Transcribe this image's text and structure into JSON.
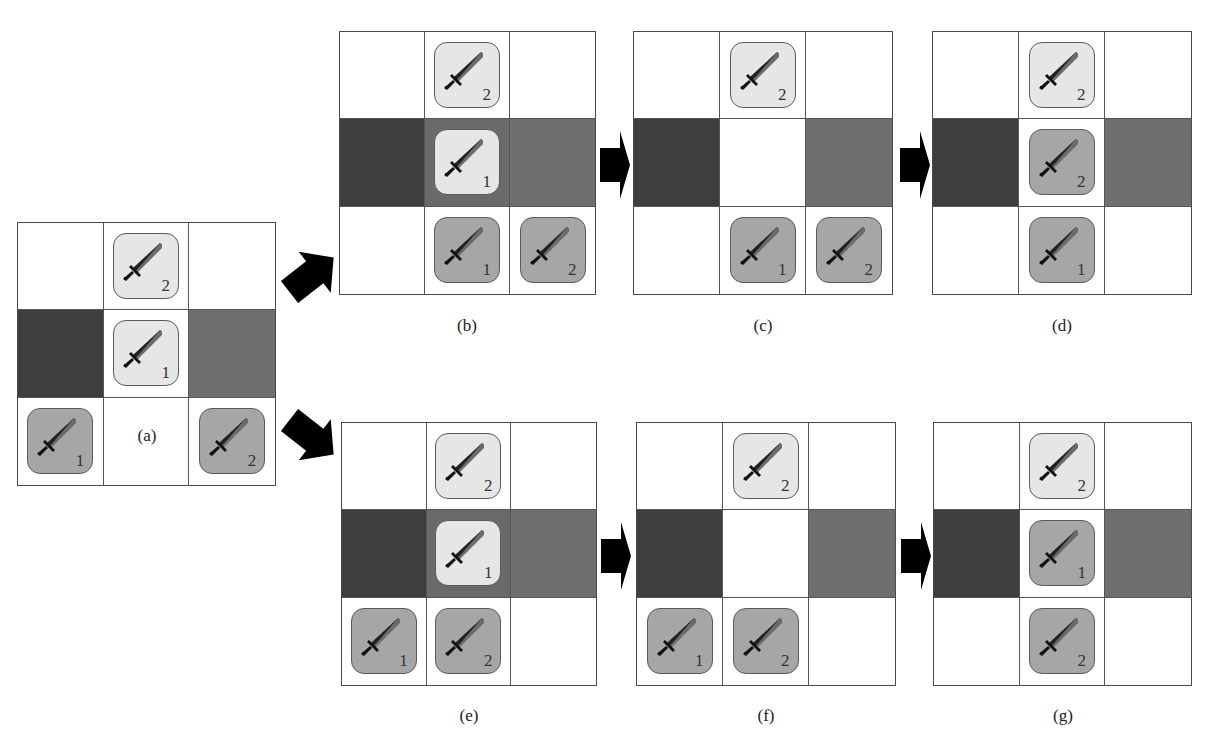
{
  "figure": {
    "colors": {
      "empty": "#ffffff",
      "dark_terrain": "#3e3e3e",
      "medium_terrain": "#6f6f6f",
      "highlight_center": "#6a6a6a",
      "tile_light": "#e6e6e6",
      "tile_dark": "#a6a6a6",
      "grid_line": "#4a4a4a",
      "arrow": "#000000"
    },
    "unit_icon": "sword-icon",
    "panels": [
      {
        "id": "a",
        "label": "(a)",
        "x": 17,
        "y": 222,
        "w": 259,
        "h": 264,
        "label_x": 147,
        "label_y": 426,
        "cells": [
          [
            {
              "bg": "empty"
            },
            {
              "bg": "empty",
              "unit": {
                "shade": "light",
                "num": "2"
              }
            },
            {
              "bg": "empty"
            }
          ],
          [
            {
              "bg": "dark_terrain"
            },
            {
              "bg": "empty",
              "unit": {
                "shade": "light",
                "num": "1"
              }
            },
            {
              "bg": "medium_terrain"
            }
          ],
          [
            {
              "bg": "empty",
              "unit": {
                "shade": "dark",
                "num": "1"
              }
            },
            {
              "bg": "empty"
            },
            {
              "bg": "empty",
              "unit": {
                "shade": "dark",
                "num": "2"
              }
            }
          ]
        ]
      },
      {
        "id": "b",
        "label": "(b)",
        "x": 339,
        "y": 31,
        "w": 257,
        "h": 264,
        "label_x": 467,
        "label_y": 316,
        "cells": [
          [
            {
              "bg": "empty"
            },
            {
              "bg": "empty",
              "unit": {
                "shade": "light",
                "num": "2"
              }
            },
            {
              "bg": "empty"
            }
          ],
          [
            {
              "bg": "dark_terrain"
            },
            {
              "bg": "highlight_center",
              "unit": {
                "shade": "light",
                "num": "1"
              }
            },
            {
              "bg": "medium_terrain"
            }
          ],
          [
            {
              "bg": "empty"
            },
            {
              "bg": "empty",
              "unit": {
                "shade": "dark",
                "num": "1"
              }
            },
            {
              "bg": "empty",
              "unit": {
                "shade": "dark",
                "num": "2"
              }
            }
          ]
        ]
      },
      {
        "id": "c",
        "label": "(c)",
        "x": 633,
        "y": 31,
        "w": 260,
        "h": 264,
        "label_x": 763,
        "label_y": 316,
        "cells": [
          [
            {
              "bg": "empty"
            },
            {
              "bg": "empty",
              "unit": {
                "shade": "light",
                "num": "2"
              }
            },
            {
              "bg": "empty"
            }
          ],
          [
            {
              "bg": "dark_terrain"
            },
            {
              "bg": "empty"
            },
            {
              "bg": "medium_terrain"
            }
          ],
          [
            {
              "bg": "empty"
            },
            {
              "bg": "empty",
              "unit": {
                "shade": "dark",
                "num": "1"
              }
            },
            {
              "bg": "empty",
              "unit": {
                "shade": "dark",
                "num": "2"
              }
            }
          ]
        ]
      },
      {
        "id": "d",
        "label": "(d)",
        "x": 932,
        "y": 31,
        "w": 260,
        "h": 264,
        "label_x": 1062,
        "label_y": 316,
        "cells": [
          [
            {
              "bg": "empty"
            },
            {
              "bg": "empty",
              "unit": {
                "shade": "light",
                "num": "2"
              }
            },
            {
              "bg": "empty"
            }
          ],
          [
            {
              "bg": "dark_terrain"
            },
            {
              "bg": "empty",
              "unit": {
                "shade": "dark",
                "num": "2"
              }
            },
            {
              "bg": "medium_terrain"
            }
          ],
          [
            {
              "bg": "empty"
            },
            {
              "bg": "empty",
              "unit": {
                "shade": "dark",
                "num": "1"
              }
            },
            {
              "bg": "empty"
            }
          ]
        ]
      },
      {
        "id": "e",
        "label": "(e)",
        "x": 341,
        "y": 422,
        "w": 256,
        "h": 264,
        "label_x": 469,
        "label_y": 706,
        "cells": [
          [
            {
              "bg": "empty"
            },
            {
              "bg": "empty",
              "unit": {
                "shade": "light",
                "num": "2"
              }
            },
            {
              "bg": "empty"
            }
          ],
          [
            {
              "bg": "dark_terrain"
            },
            {
              "bg": "highlight_center",
              "unit": {
                "shade": "light",
                "num": "1"
              }
            },
            {
              "bg": "medium_terrain"
            }
          ],
          [
            {
              "bg": "empty",
              "unit": {
                "shade": "dark",
                "num": "1"
              }
            },
            {
              "bg": "empty",
              "unit": {
                "shade": "dark",
                "num": "2"
              }
            },
            {
              "bg": "empty"
            }
          ]
        ]
      },
      {
        "id": "f",
        "label": "(f)",
        "x": 636,
        "y": 422,
        "w": 260,
        "h": 264,
        "label_x": 766,
        "label_y": 706,
        "cells": [
          [
            {
              "bg": "empty"
            },
            {
              "bg": "empty",
              "unit": {
                "shade": "light",
                "num": "2"
              }
            },
            {
              "bg": "empty"
            }
          ],
          [
            {
              "bg": "dark_terrain"
            },
            {
              "bg": "empty"
            },
            {
              "bg": "medium_terrain"
            }
          ],
          [
            {
              "bg": "empty",
              "unit": {
                "shade": "dark",
                "num": "1"
              }
            },
            {
              "bg": "empty",
              "unit": {
                "shade": "dark",
                "num": "2"
              }
            },
            {
              "bg": "empty"
            }
          ]
        ]
      },
      {
        "id": "g",
        "label": "(g)",
        "x": 933,
        "y": 422,
        "w": 259,
        "h": 264,
        "label_x": 1063,
        "label_y": 706,
        "cells": [
          [
            {
              "bg": "empty"
            },
            {
              "bg": "empty",
              "unit": {
                "shade": "light",
                "num": "2"
              }
            },
            {
              "bg": "empty"
            }
          ],
          [
            {
              "bg": "dark_terrain"
            },
            {
              "bg": "empty",
              "unit": {
                "shade": "dark",
                "num": "1"
              }
            },
            {
              "bg": "medium_terrain"
            }
          ],
          [
            {
              "bg": "empty"
            },
            {
              "bg": "empty",
              "unit": {
                "shade": "dark",
                "num": "2"
              }
            },
            {
              "bg": "empty"
            }
          ]
        ]
      }
    ],
    "arrows": [
      {
        "name": "arrow-a-to-b",
        "kind": "diagonal",
        "x": 280,
        "y": 244,
        "rotate": -38
      },
      {
        "name": "arrow-a-to-e",
        "kind": "diagonal",
        "x": 280,
        "y": 404,
        "rotate": 38
      },
      {
        "name": "arrow-b-to-c",
        "kind": "straight",
        "x": 600,
        "y": 131
      },
      {
        "name": "arrow-c-to-d",
        "kind": "straight",
        "x": 900,
        "y": 131
      },
      {
        "name": "arrow-e-to-f",
        "kind": "straight",
        "x": 601,
        "y": 522
      },
      {
        "name": "arrow-f-to-g",
        "kind": "straight",
        "x": 901,
        "y": 522
      }
    ]
  }
}
